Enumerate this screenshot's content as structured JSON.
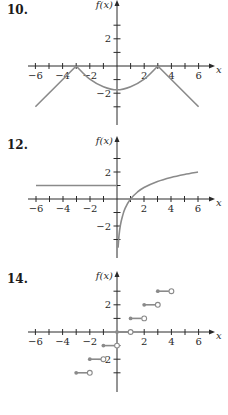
{
  "chart_data": [
    {
      "id": "p10",
      "label": "10.",
      "type": "line",
      "title": "",
      "xlabel": "x",
      "ylabel": "f(x)",
      "xlim": [
        -6,
        6
      ],
      "ylim": [
        -4,
        4
      ],
      "x_ticks": [
        -6,
        -5,
        -4,
        -3,
        -2,
        -1,
        1,
        2,
        3,
        4,
        5,
        6
      ],
      "x_tick_labels": [
        "-6",
        "-4",
        "-2",
        "2",
        "4",
        "6"
      ],
      "x_tick_label_values": [
        -6,
        -4,
        -2,
        2,
        4,
        6
      ],
      "y_ticks": [
        -3,
        -2,
        -1,
        1,
        2,
        3
      ],
      "y_tick_labels": [
        "2",
        "-2"
      ],
      "y_tick_label_values": [
        2,
        -2
      ],
      "grid": false,
      "series": [
        {
          "name": "left-line",
          "kind": "line",
          "points": [
            [
              -6,
              -3
            ],
            [
              -3,
              0
            ]
          ]
        },
        {
          "name": "middle-curve",
          "kind": "curve",
          "points": [
            [
              -3,
              0
            ],
            [
              -2,
              -0.97
            ],
            [
              -1,
              -1.52
            ],
            [
              0,
              -1.75
            ],
            [
              1,
              -1.52
            ],
            [
              2,
              -0.97
            ],
            [
              3,
              0
            ]
          ]
        },
        {
          "name": "right-line",
          "kind": "line",
          "points": [
            [
              3,
              0
            ],
            [
              6,
              -3
            ]
          ]
        }
      ]
    },
    {
      "id": "p12",
      "label": "12.",
      "type": "line",
      "title": "",
      "xlabel": "x",
      "ylabel": "f(x)",
      "xlim": [
        -6,
        6
      ],
      "ylim": [
        -4,
        4
      ],
      "x_ticks": [
        -6,
        -5,
        -4,
        -3,
        -2,
        -1,
        1,
        2,
        3,
        4,
        5,
        6
      ],
      "x_tick_labels": [
        "-6",
        "-4",
        "-2",
        "2",
        "4",
        "6"
      ],
      "x_tick_label_values": [
        -6,
        -4,
        -2,
        2,
        4,
        6
      ],
      "y_ticks": [
        -3,
        -2,
        -1,
        1,
        2,
        3
      ],
      "y_tick_labels": [
        "2",
        "-2"
      ],
      "y_tick_label_values": [
        2,
        -2
      ],
      "grid": false,
      "series": [
        {
          "name": "constant-line",
          "kind": "line",
          "points": [
            [
              -6,
              1
            ],
            [
              0,
              1
            ]
          ]
        },
        {
          "name": "log-curve",
          "kind": "curve",
          "points": [
            [
              0.08,
              -3.6
            ],
            [
              0.15,
              -2.7
            ],
            [
              0.25,
              -1.95
            ],
            [
              0.4,
              -1.3
            ],
            [
              0.6,
              -0.7
            ],
            [
              1,
              0
            ],
            [
              1.5,
              0.5
            ],
            [
              2,
              0.85
            ],
            [
              3,
              1.3
            ],
            [
              4,
              1.6
            ],
            [
              5,
              1.82
            ],
            [
              6,
              2.0
            ]
          ]
        }
      ]
    },
    {
      "id": "p14",
      "label": "14.",
      "type": "scatter",
      "title": "",
      "xlabel": "x",
      "ylabel": "f(x)",
      "xlim": [
        -6,
        6
      ],
      "ylim": [
        -4,
        4
      ],
      "x_ticks": [
        -6,
        -5,
        -4,
        -3,
        -2,
        -1,
        1,
        2,
        3,
        4,
        5,
        6
      ],
      "x_tick_labels": [
        "-6",
        "-4",
        "-2",
        "2",
        "4",
        "6"
      ],
      "x_tick_label_values": [
        -6,
        -4,
        -2,
        2,
        4,
        6
      ],
      "y_ticks": [
        -3,
        -2,
        -1,
        1,
        2,
        3
      ],
      "y_tick_labels": [
        "2",
        "-2"
      ],
      "y_tick_label_values": [
        2,
        -2
      ],
      "grid": false,
      "series": [
        {
          "name": "step-function",
          "kind": "steps",
          "segments": [
            {
              "x0": -3,
              "x1": -2,
              "y": -3
            },
            {
              "x0": -2,
              "x1": -1,
              "y": -2
            },
            {
              "x0": -1,
              "x1": 0,
              "y": -1
            },
            {
              "x0": 0,
              "x1": 1,
              "y": 0
            },
            {
              "x0": 1,
              "x1": 2,
              "y": 1
            },
            {
              "x0": 2,
              "x1": 3,
              "y": 2
            },
            {
              "x0": 3,
              "x1": 4,
              "y": 3
            }
          ]
        }
      ]
    }
  ]
}
